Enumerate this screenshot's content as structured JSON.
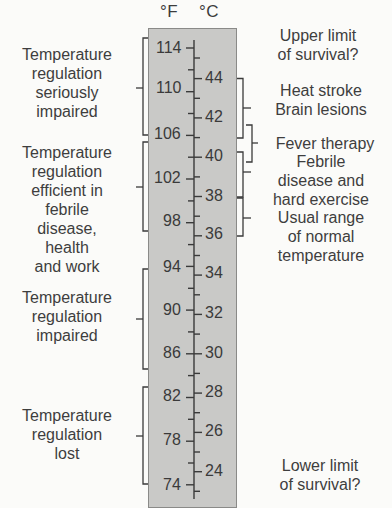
{
  "units": {
    "fahrenheit": "°F",
    "celsius": "°C"
  },
  "colors": {
    "background": "#fbfbf9",
    "panel": "#c9c9c7",
    "panel_border": "#8a8a88",
    "ink": "#3a3a3a"
  },
  "scale": {
    "fahrenheit_ticks": [
      "114",
      "110",
      "106",
      "102",
      "98",
      "94",
      "90",
      "86",
      "82",
      "78",
      "74"
    ],
    "celsius_ticks": [
      "44",
      "42",
      "40",
      "38",
      "36",
      "34",
      "32",
      "30",
      "28",
      "26",
      "24"
    ]
  },
  "left_labels": [
    {
      "text": "Temperature\nregulation\nseriously\nimpaired",
      "range_f": [
        106,
        114
      ]
    },
    {
      "text": "Temperature\nregulation\nefficient in\nfebrile\ndisease,\nhealth\nand work",
      "range_f": [
        97,
        105.5
      ]
    },
    {
      "text": "Temperature\nregulation\nimpaired",
      "range_f": [
        85,
        94
      ]
    },
    {
      "text": "Temperature\nregulation\nlost",
      "range_f": [
        74.5,
        83
      ]
    }
  ],
  "right_labels": [
    {
      "text": "Upper limit\nof survival?"
    },
    {
      "text": "Heat stroke\nBrain lesions",
      "range_c": [
        41,
        44
      ]
    },
    {
      "text": "Fever therapy",
      "range_c": [
        40,
        42
      ]
    },
    {
      "text": "Febrile\ndisease and\nhard exercise",
      "range_c": [
        38,
        40
      ]
    },
    {
      "text": "Usual range\nof normal\ntemperature",
      "range_c": [
        36,
        38
      ]
    },
    {
      "text": "Lower limit\nof survival?"
    }
  ]
}
